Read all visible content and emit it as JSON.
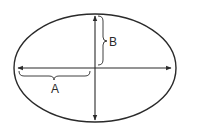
{
  "diagram": {
    "type": "ellipse-axes",
    "colors": {
      "background": "#ffffff",
      "stroke": "#2a2a2a"
    },
    "ellipse": {
      "cx": 95,
      "cy": 68,
      "rx": 81,
      "ry": 54
    },
    "axes": {
      "horizontal": {
        "x1": 18,
        "x2": 171,
        "y": 68,
        "arrows": "both"
      },
      "vertical": {
        "x": 95,
        "y1": 16,
        "y2": 120,
        "arrows": "both"
      }
    },
    "labels": {
      "semi_major": {
        "text": "A",
        "description": "semi-major axis (left half of horizontal axis)",
        "x": 55,
        "y": 93
      },
      "semi_minor": {
        "text": "B",
        "description": "semi-minor axis (upper half of vertical axis)",
        "x": 109,
        "y": 46
      }
    }
  }
}
